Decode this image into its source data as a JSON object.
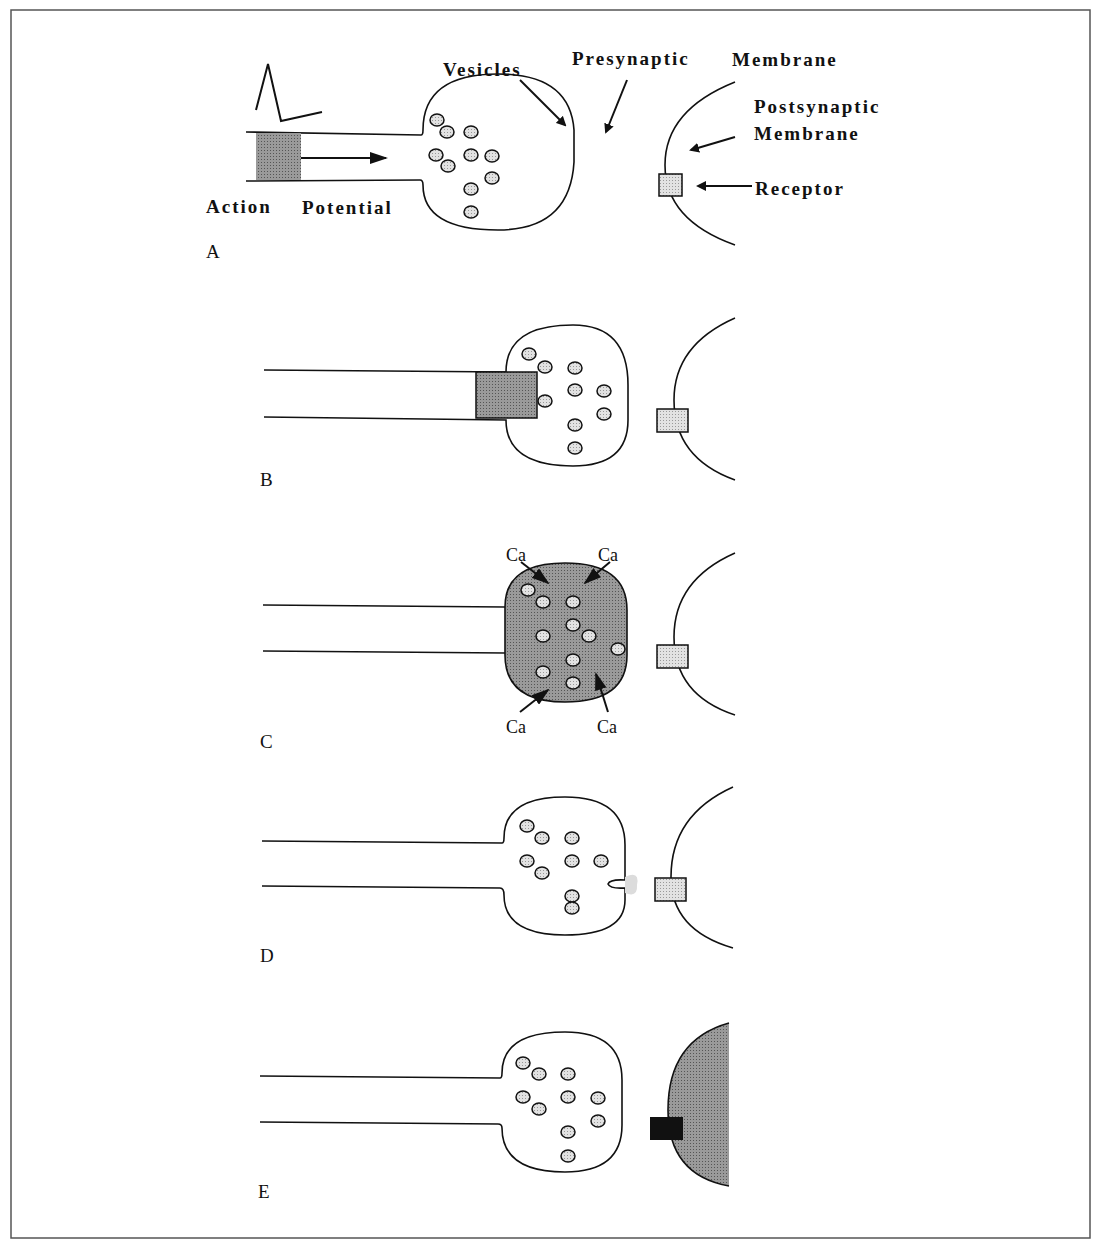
{
  "figure": {
    "panels": {
      "A": {
        "label": "A"
      },
      "B": {
        "label": "B"
      },
      "C": {
        "label": "C"
      },
      "D": {
        "label": "D"
      },
      "E": {
        "label": "E"
      }
    },
    "annotations": {
      "vesicles": "Vesicles",
      "presynaptic": "Presynaptic",
      "membrane": "Membrane",
      "postsynaptic": "Postsynaptic",
      "postsynaptic_membrane": "Membrane",
      "receptor": "Receptor",
      "action": "Action",
      "potential": "Potential",
      "calcium": "Ca"
    },
    "colors": {
      "stroke": "#111111",
      "shade_dark": "#8a8a8a",
      "shade_light": "#d8d8d8",
      "receptor_active": "#111111",
      "frame": "#555555"
    }
  }
}
